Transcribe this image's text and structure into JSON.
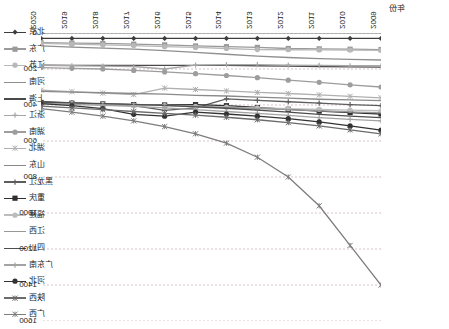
{
  "axis_title": "年份",
  "chart_data": {
    "type": "line",
    "title": "",
    "xlabel": "年份",
    "ylabel": "",
    "grid": true,
    "legend_position": "left",
    "y_inverted": true,
    "ylim": [
      0,
      1600
    ],
    "yticks": [
      0,
      200,
      400,
      600,
      800,
      1000,
      1200,
      1400,
      1600
    ],
    "x": [
      "2009",
      "2010",
      "2011",
      "2012",
      "2013",
      "2014",
      "2015",
      "2016",
      "2017",
      "2018",
      "2019",
      "2020"
    ],
    "x_display_order": [
      "2020",
      "2019",
      "2018",
      "2017",
      "2016",
      "2015",
      "2014",
      "2013",
      "2012",
      "2011",
      "2010",
      "2009"
    ],
    "series": [
      {
        "name": "北京",
        "color": "#3d3d3d",
        "marker": "diamond",
        "values": [
          30,
          30,
          30,
          30,
          30,
          30,
          30,
          30,
          30,
          30,
          30,
          30
        ]
      },
      {
        "name": "广东",
        "color": "#9a9a9a",
        "marker": "square",
        "values": [
          92,
          90,
          88,
          86,
          80,
          76,
          72,
          66,
          62,
          58,
          56,
          54
        ]
      },
      {
        "name": "江苏",
        "color": "#b8b8b8",
        "marker": "circle",
        "values": [
          96,
          95,
          94,
          93,
          92,
          86,
          80,
          76,
          70,
          66,
          62,
          58
        ]
      },
      {
        "name": "河南",
        "color": "#8f8f8f",
        "marker": "line",
        "values": [
          150,
          146,
          142,
          136,
          128,
          118,
          108,
          98,
          90,
          84,
          78,
          72
        ]
      },
      {
        "name": "上海",
        "color": "#4a4a4a",
        "marker": "line",
        "values": [
          190,
          188,
          186,
          184,
          182,
          180,
          180,
          180,
          180,
          180,
          180,
          178
        ]
      },
      {
        "name": "浙江",
        "color": "#a7a7a7",
        "marker": "plus",
        "values": [
          182,
          182,
          180,
          178,
          176,
          176,
          178,
          200,
          186,
          184,
          182,
          180
        ]
      },
      {
        "name": "湖南",
        "color": "#9d9d9d",
        "marker": "circle",
        "values": [
          300,
          288,
          274,
          262,
          248,
          236,
          226,
          216,
          208,
          200,
          196,
          192
        ]
      },
      {
        "name": "湖北",
        "color": "#b0b0b0",
        "marker": "star",
        "values": [
          360,
          352,
          344,
          336,
          330,
          322,
          314,
          306,
          342,
          334,
          326,
          318
        ]
      },
      {
        "name": "山东",
        "color": "#8a8a8a",
        "marker": "line",
        "values": [
          376,
          372,
          368,
          362,
          356,
          350,
          346,
          340,
          336,
          332,
          328,
          324
        ]
      },
      {
        "name": "黑龙江",
        "color": "#5d5d5d",
        "marker": "plus",
        "values": [
          404,
          398,
          390,
          382,
          374,
          366,
          416,
          430,
          404,
          396,
          388,
          380
        ]
      },
      {
        "name": "重庆",
        "color": "#2f2f2f",
        "marker": "square",
        "values": [
          450,
          442,
          434,
          424,
          414,
          404,
          398,
          400,
          398,
          394,
          390,
          386
        ]
      },
      {
        "name": "福建",
        "color": "#bcbcbc",
        "marker": "circle",
        "values": [
          432,
          428,
          424,
          420,
          416,
          412,
          408,
          404,
          400,
          396,
          392,
          390
        ]
      },
      {
        "name": "江西",
        "color": "#979797",
        "marker": "line",
        "values": [
          444,
          438,
          432,
          426,
          420,
          414,
          408,
          402,
          398,
          394,
          390,
          386
        ]
      },
      {
        "name": "四川",
        "color": "#4d4d4d",
        "marker": "line",
        "values": [
          470,
          462,
          452,
          440,
          428,
          418,
          410,
          402,
          396,
          392,
          388,
          384
        ]
      },
      {
        "name": "广东南",
        "color": "#a3a3a3",
        "marker": "plus",
        "values": [
          488,
          480,
          470,
          458,
          446,
          436,
          426,
          416,
          408,
          402,
          396,
          392
        ]
      },
      {
        "name": "河北",
        "color": "#333333",
        "marker": "circle",
        "values": [
          540,
          516,
          494,
          476,
          462,
          450,
          440,
          462,
          452,
          420,
          404,
          392
        ]
      },
      {
        "name": "陕西",
        "color": "#6b6b6b",
        "marker": "star",
        "values": [
          560,
          538,
          516,
          498,
          482,
          468,
          456,
          446,
          436,
          426,
          416,
          406
        ]
      },
      {
        "name": "广西",
        "color": "#7d7d7d",
        "marker": "star",
        "values": [
          1400,
          1180,
          960,
          800,
          690,
          612,
          560,
          520,
          488,
          462,
          440,
          420
        ]
      }
    ]
  }
}
